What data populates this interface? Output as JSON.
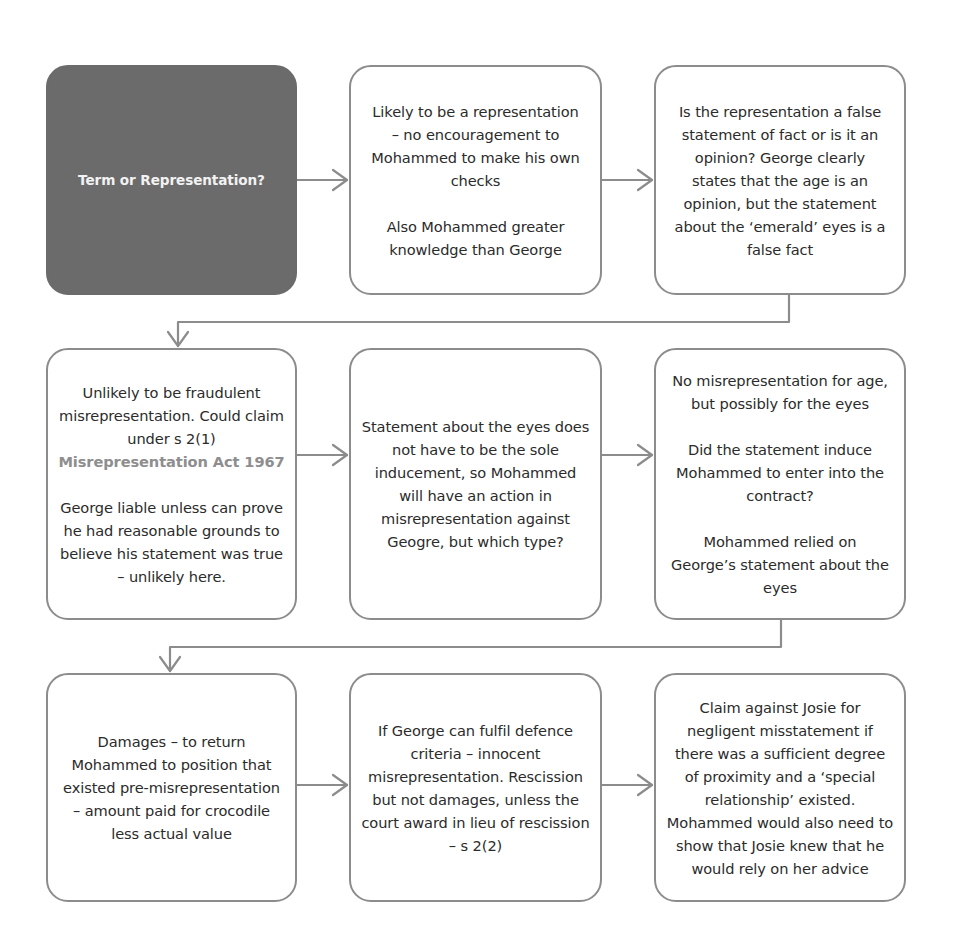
{
  "diagram": {
    "type": "flowchart",
    "top_cutoff_text": "",
    "colors": {
      "start_box_fill": "#6b6b6b",
      "start_box_text": "#f2f2f2",
      "box_border": "#8c8c8c",
      "connector": "#8c8c8c",
      "statute_reference": "#8e8e8e",
      "body_text": "#2b2b2b"
    },
    "rows": [
      {
        "boxes": [
          {
            "id": "term-or-representation",
            "style": "dark",
            "paragraphs": [
              "Term or Representation?"
            ]
          },
          {
            "id": "likely-representation",
            "style": "outline",
            "paragraphs": [
              "Likely to be a representation – no encouragement to Mohammed to make his own checks",
              "Also Mohammed greater knowledge than George"
            ]
          },
          {
            "id": "fact-or-opinion",
            "style": "outline",
            "paragraphs": [
              "Is the representation a false statement of fact or is it an opinion? George clearly states that the age is an opinion, but the statement about the ‘emerald’ eyes is a false fact"
            ]
          }
        ]
      },
      {
        "boxes": [
          {
            "id": "unlikely-fraudulent",
            "style": "outline",
            "paragraphs": [
              "Unlikely to be fraudulent misrepresentation. Could claim under s 2(1)",
              "George liable unless can prove he had reasonable grounds to believe his statement was true – unlikely here."
            ],
            "statute_reference": "Misrepresentation Act 1967"
          },
          {
            "id": "sole-inducement",
            "style": "outline",
            "paragraphs": [
              "Statement about the eyes does not have to be the sole inducement, so Mohammed will have an action in misrepresentation against Geogre, but which type?"
            ]
          },
          {
            "id": "no-misrep-for-age",
            "style": "outline",
            "paragraphs": [
              "No misrepresentation for age, but possibly for the eyes",
              "Did the statement induce Mohammed to enter into the contract?",
              "Mohammed relied on George’s statement about the eyes"
            ]
          }
        ]
      },
      {
        "boxes": [
          {
            "id": "damages",
            "style": "outline",
            "paragraphs": [
              "Damages – to return Mohammed to position that existed pre-misrepresentation – amount paid for crocodile less actual value"
            ]
          },
          {
            "id": "innocent-misrep",
            "style": "outline",
            "paragraphs": [
              "If George can fulfil defence criteria – innocent misrepresentation. Rescission but not damages, unless the court award in lieu of rescission – s 2(2)"
            ]
          },
          {
            "id": "claim-against-josie",
            "style": "outline",
            "paragraphs": [
              "Claim against Josie for negligent misstatement if there was a sufficient degree of proximity and a ‘special relationship’ existed. Mohammed would also need to show that Josie knew that he would rely on her advice"
            ]
          }
        ]
      }
    ],
    "connections": [
      {
        "from": "term-or-representation",
        "to": "likely-representation",
        "kind": "right-arrow"
      },
      {
        "from": "likely-representation",
        "to": "fact-or-opinion",
        "kind": "right-arrow"
      },
      {
        "from": "fact-or-opinion",
        "to": "unlikely-fraudulent",
        "kind": "elbow-down-left-down"
      },
      {
        "from": "unlikely-fraudulent",
        "to": "sole-inducement",
        "kind": "right-arrow"
      },
      {
        "from": "sole-inducement",
        "to": "no-misrep-for-age",
        "kind": "right-arrow"
      },
      {
        "from": "no-misrep-for-age",
        "to": "damages",
        "kind": "elbow-down-left-down"
      },
      {
        "from": "damages",
        "to": "innocent-misrep",
        "kind": "right-arrow"
      },
      {
        "from": "innocent-misrep",
        "to": "claim-against-josie",
        "kind": "right-arrow"
      }
    ]
  }
}
